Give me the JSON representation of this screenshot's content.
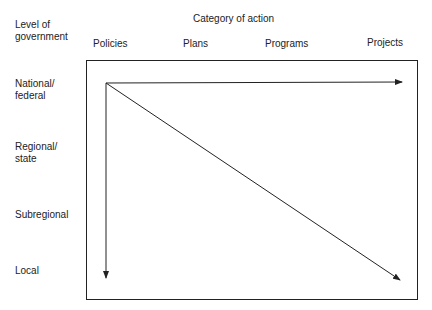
{
  "diagram": {
    "row_axis_title": "Level of\ngovernment",
    "column_axis_title": "Category of action",
    "columns": [
      "Policies",
      "Plans",
      "Programs",
      "Projects"
    ],
    "rows": [
      "National/\nfederal",
      "Regional/\nstate",
      "Subregional",
      "Local"
    ],
    "arrows": [
      {
        "from": "National/federal - Policies",
        "to": "National/federal - Projects",
        "direction": "horizontal"
      },
      {
        "from": "National/federal - Policies",
        "to": "Local - Policies",
        "direction": "vertical"
      },
      {
        "from": "National/federal - Policies",
        "to": "Local - Projects",
        "direction": "diagonal"
      }
    ],
    "line_color": "#222222"
  }
}
